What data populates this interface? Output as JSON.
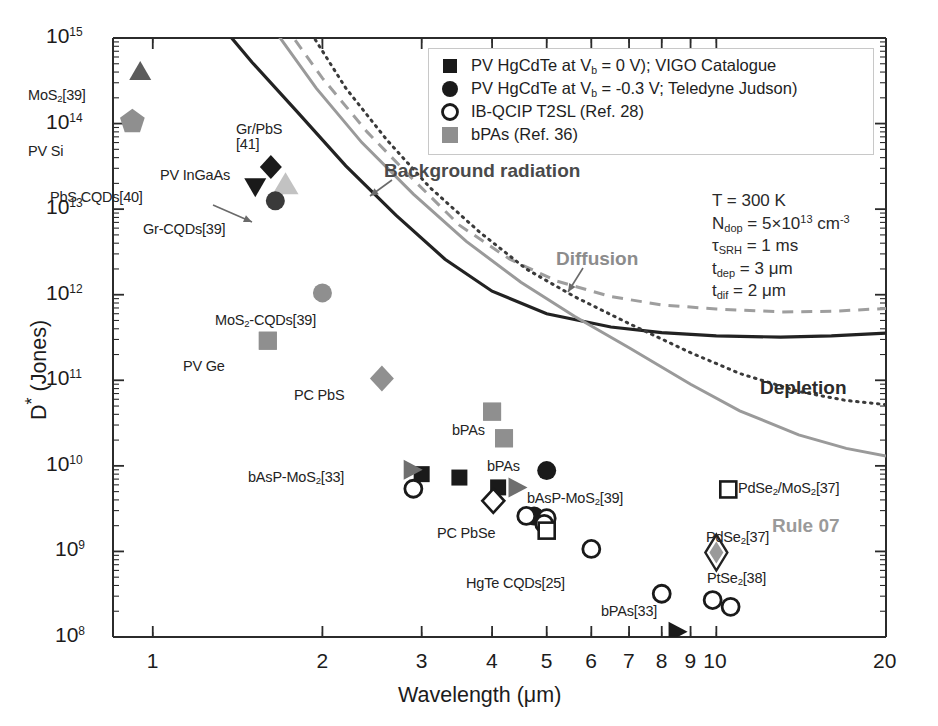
{
  "figure": {
    "xlabel_text": "Wavelength (",
    "xlabel_unit": "μm)",
    "ylabel": "D* (Jones)"
  },
  "axes": {
    "x_ticks": [
      "1",
      "2",
      "3",
      "4",
      "5",
      "6",
      "7",
      "8",
      "9",
      "10",
      "20"
    ],
    "x_tick_values": [
      1,
      2,
      3,
      4,
      5,
      6,
      7,
      8,
      9,
      10,
      20
    ],
    "y_ticks": [
      "8",
      "9",
      "10",
      "11",
      "12",
      "13",
      "14",
      "15"
    ],
    "y_tick_base": "10",
    "xlim": [
      0.85,
      20
    ],
    "ylim": [
      100000000.0,
      1000000000000000.0
    ]
  },
  "legend": {
    "items": [
      {
        "marker": "filled-square",
        "color": "#1a1a1a",
        "label_pre": "PV HgCdTe at V",
        "label_sub": "b",
        "label_post": " = 0 V); VIGO Catalogue"
      },
      {
        "marker": "filled-circle",
        "color": "#1a1a1a",
        "label_pre": "PV HgCdTe at V",
        "label_sub": "b",
        "label_post": " = -0.3 V; Teledyne Judson)"
      },
      {
        "marker": "open-circle",
        "color": "#1a1a1a",
        "label_pre": "IB-QCIP T2SL (Ref. 28)",
        "label_sub": "",
        "label_post": ""
      },
      {
        "marker": "filled-square-gray",
        "color": "#8f8f8f",
        "label_pre": "bPAs (Ref. 36)",
        "label_sub": "",
        "label_post": ""
      }
    ]
  },
  "conditions": [
    {
      "pre": "T = 300 K",
      "sub": "",
      "post": ""
    },
    {
      "pre": "N",
      "sub": "dop",
      "post": " = 5×10",
      "sup": "13",
      "tail": " cm",
      "sup2": "-3"
    },
    {
      "pre": "τ",
      "sub": "SRH",
      "post": " = 1 ms"
    },
    {
      "pre": "t",
      "sub": "dep",
      "post": " = 3 μm"
    },
    {
      "pre": "t",
      "sub": "dif",
      "post": " = 2 μm"
    }
  ],
  "curve_labels": [
    {
      "name": "background-radiation",
      "text": "Background radiation",
      "color": "#4a4a4a",
      "x": 384,
      "y": 160
    },
    {
      "name": "diffusion",
      "text": "Diffusion",
      "color": "#8c8c8c",
      "x": 556,
      "y": 248
    },
    {
      "name": "depletion",
      "text": "Depletion",
      "color": "#2b2b2b",
      "x": 760,
      "y": 377
    },
    {
      "name": "rule-07",
      "text": "Rule 07",
      "color": "#9a9a9a",
      "x": 772,
      "y": 515
    }
  ],
  "chart_data": {
    "type": "scatter",
    "title": "",
    "xlabel": "Wavelength (μm)",
    "ylabel": "D* (Jones)",
    "xscale": "log",
    "yscale": "log",
    "xlim": [
      0.85,
      20
    ],
    "ylim": [
      100000000.0,
      1000000000000000.0
    ],
    "grid": false,
    "legend_position": "top-right",
    "annotations": [
      "T = 300 K",
      "N_dop = 5×10^13 cm^-3",
      "τ_SRH = 1 ms",
      "t_dep = 3 μm",
      "t_dif = 2 μm"
    ],
    "points": [
      {
        "label": "MoS2[39]",
        "label_html": "MoS<sub>2</sub>[39]",
        "x": 0.95,
        "y": 400000000000000.0,
        "marker": "triangle-up",
        "color": "#5c5c5c",
        "lx": 28,
        "ly": 88,
        "anchor": "start"
      },
      {
        "label": "PV Si",
        "label_html": "PV Si",
        "x": 0.92,
        "y": 105000000000000.0,
        "marker": "pentagon",
        "color": "#8f8f8f",
        "lx": 28,
        "ly": 144,
        "anchor": "start"
      },
      {
        "label": "Gr/PbS [41]",
        "label_html": "Gr/PbS<br>[41]",
        "x": 1.62,
        "y": 31000000000000.0,
        "marker": "diamond",
        "color": "#1a1a1a",
        "lx": 236,
        "ly": 122,
        "anchor": "start"
      },
      {
        "label": "PV InGaAs",
        "label_html": "PV InGaAs",
        "x": 1.72,
        "y": 19000000000000.0,
        "marker": "triangle-up-light",
        "color": "#c2c2c2",
        "lx": 160,
        "ly": 168,
        "anchor": "start"
      },
      {
        "label": "PbS CQDs[40]",
        "label_html": "PbS CQDs[40]",
        "x": 1.52,
        "y": 18500000000000.0,
        "marker": "triangle-down",
        "color": "#1a1a1a",
        "lx": 50,
        "ly": 190,
        "anchor": "start"
      },
      {
        "label": "Gr-CQDs[39]",
        "label_html": "Gr-CQDs[39]",
        "x": 1.65,
        "y": 12500000000000.0,
        "marker": "circle",
        "color": "#3a3a3a",
        "lx": 143,
        "ly": 222,
        "anchor": "start"
      },
      {
        "label": "MoS2-CQDs[39]",
        "label_html": "MoS<sub>2</sub>-CQDs[39]",
        "x": 2.0,
        "y": 1050000000000.0,
        "marker": "circle",
        "color": "#8f8f8f",
        "lx": 215,
        "ly": 313,
        "anchor": "start"
      },
      {
        "label": "PV Ge",
        "label_html": "PV Ge",
        "x": 1.6,
        "y": 290000000000.0,
        "marker": "square",
        "color": "#8f8f8f",
        "lx": 183,
        "ly": 359,
        "anchor": "start"
      },
      {
        "label": "PC PbS",
        "label_html": "PC PbS",
        "x": 2.55,
        "y": 105000000000.0,
        "marker": "diamond-gray",
        "color": "#909090",
        "lx": 294,
        "ly": 388,
        "anchor": "start"
      },
      {
        "label": "bPAs-upper",
        "label_html": "bPAs",
        "x": 4.0,
        "y": 43000000000.0,
        "marker": "square",
        "color": "#8f8f8f",
        "lx": 452,
        "ly": 423,
        "anchor": "start"
      },
      {
        "label": "bPAs-lower",
        "label_html": "bPAs",
        "x": 4.2,
        "y": 21000000000.0,
        "marker": "square",
        "color": "#8f8f8f",
        "lx": 487,
        "ly": 459,
        "anchor": "start"
      },
      {
        "label": "bAsP-MoS2[33]",
        "label_html": "bAsP-MoS<sub>2</sub>[33]",
        "x": 2.88,
        "y": 9000000000.0,
        "marker": "triangle-right",
        "color": "#6f6f6f",
        "lx": 248,
        "ly": 470,
        "anchor": "start"
      },
      {
        "label": "bAsP-MoS2[39]",
        "label_html": "bAsP-MoS<sub>2</sub>[39]",
        "x": 4.42,
        "y": 5600000000.0,
        "marker": "triangle-right",
        "color": "#6f6f6f",
        "lx": 527,
        "ly": 491,
        "anchor": "start"
      },
      {
        "label": "PC PbSe",
        "label_html": "PC PbSe",
        "x": 4.02,
        "y": 3900000000.0,
        "marker": "open-diamond",
        "color": "#1a1a1a",
        "lx": 437,
        "ly": 526,
        "anchor": "start"
      },
      {
        "label": "HgTe CQDs[25]",
        "label_html": "HgTe CQDs[25]",
        "x": 5.0,
        "y": 1750000000.0,
        "marker": "open-square",
        "color": "#1a1a1a",
        "lx": 466,
        "ly": 576,
        "anchor": "start"
      },
      {
        "label": "PdSe2/MoS2[37]",
        "label_html": "PdSe<sub>2</sub>/MoS<sub>2</sub>[37]",
        "x": 10.5,
        "y": 5300000000.0,
        "marker": "open-square",
        "color": "#1a1a1a",
        "lx": 738,
        "ly": 481,
        "anchor": "start"
      },
      {
        "label": "PdSe2[37]",
        "label_html": "PdSe<sub>2</sub>[37]",
        "x": 10.0,
        "y": 970000000.0,
        "marker": "open-diamond-gray",
        "color": "#8a8a8a",
        "lx": 706,
        "ly": 530,
        "anchor": "start"
      },
      {
        "label": "PtSe2[38]",
        "label_html": "PtSe<sub>2</sub>[38]",
        "x": 10.0,
        "y": 970000000.0,
        "marker": "none",
        "color": "#1a1a1a",
        "lx": 707,
        "ly": 571,
        "anchor": "start"
      },
      {
        "label": "bPAs[33]",
        "label_html": "bPAs[33]",
        "x": 8.5,
        "y": 115000000.0,
        "marker": "triangle-right",
        "color": "#1a1a1a",
        "lx": 601,
        "ly": 604,
        "anchor": "start"
      }
    ],
    "series": [
      {
        "name": "PV HgCdTe Vb=0V (VIGO)",
        "marker": "filled-square",
        "color": "#1a1a1a",
        "data": [
          [
            3.0,
            8000000000.0
          ],
          [
            3.5,
            7300000000.0
          ],
          [
            4.1,
            5600000000.0
          ]
        ]
      },
      {
        "name": "PV HgCdTe Vb=-0.3V (Teledyne Judson)",
        "marker": "filled-circle",
        "color": "#1a1a1a",
        "data": [
          [
            5.0,
            8800000000.0
          ],
          [
            4.75,
            2600000000.0
          ]
        ]
      },
      {
        "name": "IB-QCIP T2SL (Ref. 28)",
        "marker": "open-circle",
        "color": "#1a1a1a",
        "data": [
          [
            2.9,
            5400000000.0
          ],
          [
            4.6,
            2600000000.0
          ],
          [
            5.0,
            2450000000.0
          ],
          [
            4.95,
            2100000000.0
          ],
          [
            6.0,
            1070000000.0
          ],
          [
            8.0,
            320000000.0
          ],
          [
            9.85,
            270000000.0
          ],
          [
            10.6,
            225000000.0
          ]
        ]
      },
      {
        "name": "bPAs (Ref. 36)",
        "marker": "filled-square-gray",
        "color": "#8f8f8f",
        "data": [
          [
            1.6,
            290000000000.0
          ],
          [
            4.0,
            43000000000.0
          ],
          [
            4.2,
            21000000000.0
          ]
        ]
      }
    ],
    "curves": [
      {
        "name": "Background radiation",
        "style": "dotted",
        "color": "#3a3a3a"
      },
      {
        "name": "Diffusion",
        "style": "dashed",
        "color": "#9a9a9a"
      },
      {
        "name": "Depletion",
        "style": "solid",
        "color": "#2b2b2b"
      },
      {
        "name": "Rule 07",
        "style": "solid",
        "color": "#9a9a9a"
      },
      {
        "name": "Depletion-dotted-lower",
        "style": "dotted",
        "color": "#3a3a3a"
      }
    ]
  }
}
